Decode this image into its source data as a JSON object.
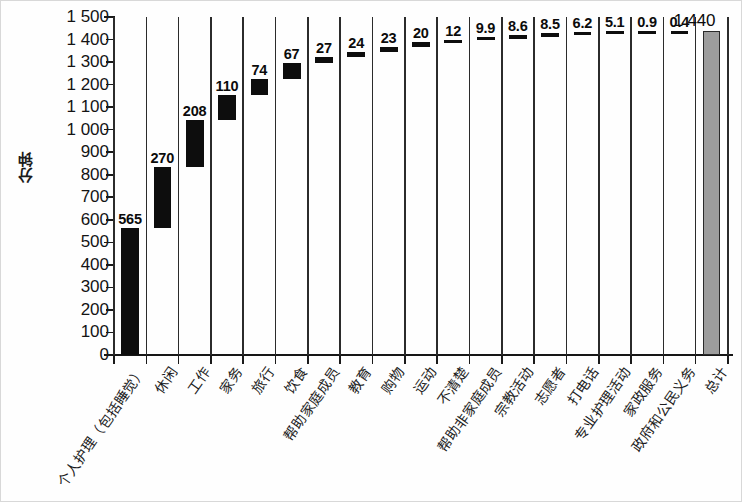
{
  "chart_data": {
    "type": "bar",
    "title": "",
    "subtitle": "",
    "xlabel": "",
    "ylabel": "分钟",
    "ylim": [
      0,
      1500
    ],
    "ytick_step": 100,
    "grid": false,
    "legend": "none",
    "note": "Waterfall chart: each category segment is stacked cumulatively from the running total; the final bar is the grand total.",
    "ytick_labels": [
      "1 500",
      "1 400",
      "1 300",
      "1 200",
      "1 100",
      "1 000",
      "900",
      "800",
      "700",
      "600",
      "500",
      "400",
      "300",
      "200",
      "100",
      "0"
    ],
    "ytick_values": [
      1500,
      1400,
      1300,
      1200,
      1100,
      1000,
      900,
      800,
      700,
      600,
      500,
      400,
      300,
      200,
      100,
      0
    ],
    "categories": [
      "个人护理（包括睡觉）",
      "休闲",
      "工作",
      "家务",
      "旅行",
      "饮食",
      "帮助家庭成员",
      "教育",
      "购物",
      "运动",
      "不清楚",
      "帮助非家庭成员",
      "宗教活动",
      "志愿者",
      "打电话",
      "专业护理活动",
      "家政服务",
      "政府和公民义务",
      "总计"
    ],
    "values": [
      565,
      270,
      208,
      110,
      74,
      67,
      27,
      24,
      23,
      20,
      12,
      9.9,
      8.6,
      8.5,
      6.2,
      5.1,
      0.9,
      0.4,
      1440
    ],
    "value_labels": [
      "565",
      "270",
      "208",
      "110",
      "74",
      "67",
      "27",
      "24",
      "23",
      "20",
      "12",
      "9.9",
      "8.6",
      "8.5",
      "6.2",
      "5.1",
      "0.9",
      "0.4",
      "1 440"
    ],
    "segment_bases": [
      0,
      565,
      835,
      1043,
      1153,
      1227,
      1294,
      1321,
      1345,
      1368,
      1388,
      1400,
      1409.9,
      1418.5,
      1427,
      1433.2,
      1438.3,
      1439.2,
      0
    ],
    "segment_tops": [
      565,
      835,
      1043,
      1153,
      1227,
      1294,
      1321,
      1345,
      1368,
      1388,
      1400,
      1409.9,
      1418.5,
      1427,
      1433.2,
      1438.3,
      1439.2,
      1439.6,
      1440
    ],
    "colors": {
      "segment": "#0d0d0d",
      "total": "#9d9d9d",
      "axis": "#161616",
      "separator": "#2b2b2b",
      "text": "#141414",
      "background": "#ffffff"
    }
  }
}
